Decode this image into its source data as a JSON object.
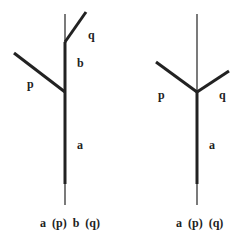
{
  "diagram": {
    "type": "tree-branching",
    "colors": {
      "line": "#222222",
      "background": "#ffffff"
    },
    "left_tree": {
      "labels": {
        "q": "q",
        "b": "b",
        "p": "p",
        "a": "a"
      },
      "caption": "a (p) b (q)"
    },
    "right_tree": {
      "labels": {
        "p": "p",
        "q": "q",
        "a": "a"
      },
      "caption": "a (p) (q)"
    }
  }
}
